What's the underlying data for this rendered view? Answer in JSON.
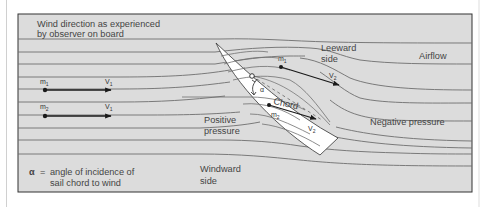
{
  "diagram": {
    "title_line1": "Wind direction as experienced",
    "title_line2": "by observer on board",
    "labels": {
      "leeward_line1": "Leeward",
      "leeward_line2": "side",
      "airflow": "Airflow",
      "chord": "Chord",
      "alpha": "α",
      "positive_line1": "Positive",
      "positive_line2": "pressure",
      "negative": "Negative pressure",
      "windward_line1": "Windward",
      "windward_line2": "side"
    },
    "legend": {
      "symbol": "α",
      "equals": "=",
      "line1": "angle of incidence of",
      "line2": "sail chord to wind"
    },
    "particles": [
      {
        "mass": "m",
        "mass_sub": "1",
        "velocity": "V",
        "velocity_sub": "1"
      },
      {
        "mass": "m",
        "mass_sub": "2",
        "velocity": "V",
        "velocity_sub": "1"
      },
      {
        "mass": "m",
        "mass_sub": "1",
        "velocity": "V",
        "velocity_sub": "2"
      },
      {
        "mass": "m",
        "mass_sub": "2",
        "velocity": "V",
        "velocity_sub": "2"
      }
    ],
    "colors": {
      "background": "#dcdcdc",
      "sail": "#ffffff",
      "lines": "#6e6e6e",
      "arrows": "#1a1a1a",
      "frame": "#333333"
    }
  }
}
